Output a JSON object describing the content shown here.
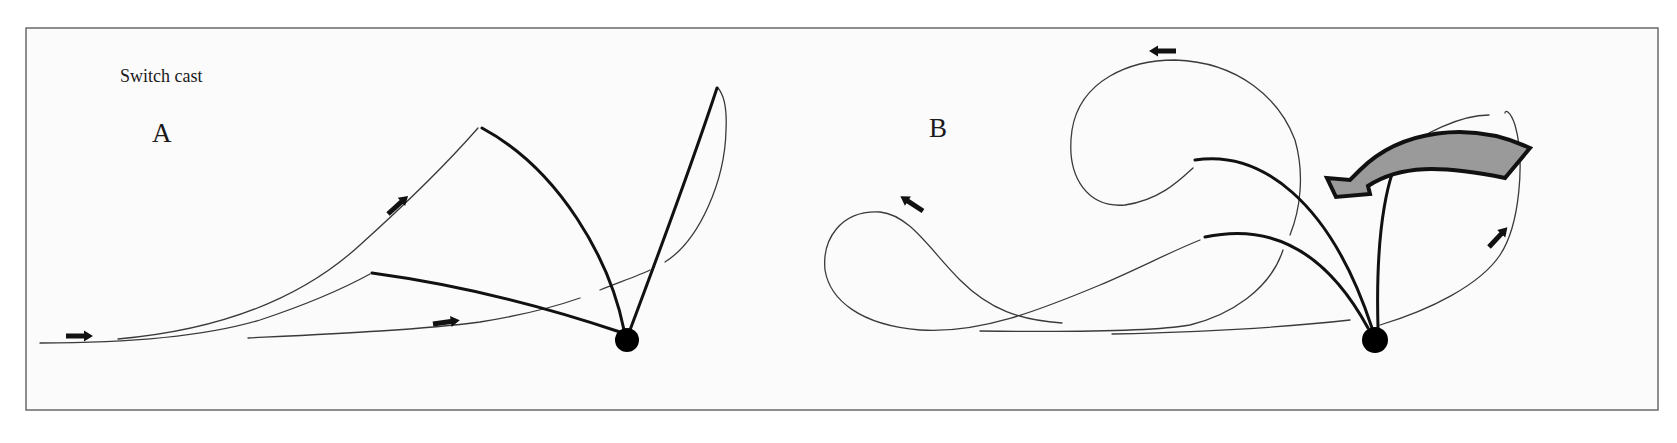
{
  "figure": {
    "title": "Switch cast",
    "panels": [
      {
        "id": "A",
        "label": "A"
      },
      {
        "id": "B",
        "label": "B"
      }
    ],
    "colors": {
      "background": "#fbfbfb",
      "frame": "#6a6a6a",
      "line": "#3a3a3a",
      "rod": "#111111",
      "big_arrow_fill": "#9a9a9a",
      "dot": "#000000"
    },
    "icons": {
      "direction_arrows": "small black arrows indicating line travel",
      "rotation_arrow": "large gray curved arrow indicating rod rotation (panel B)",
      "rod_tip": "black dot marking rod handle position"
    }
  }
}
